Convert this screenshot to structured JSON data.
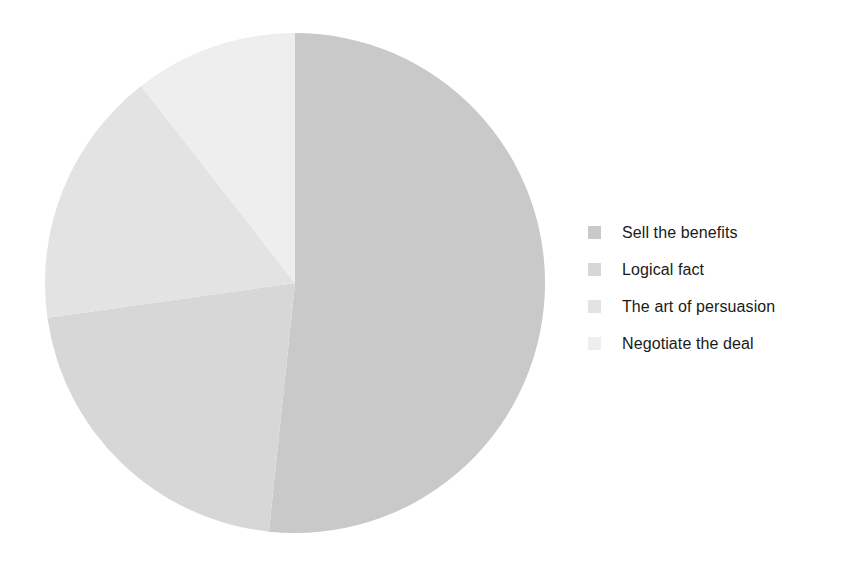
{
  "chart_data": {
    "type": "pie",
    "title": "",
    "subtitle": "",
    "xlabel": "",
    "ylabel": "",
    "grid": false,
    "legend_position": "right",
    "start_angle_deg": 0,
    "direction": "clockwise",
    "categories": [
      "Sell the benefits",
      "Logical fact",
      "The art of persuasion",
      "Negotiate the deal"
    ],
    "values": [
      51.5,
      21.0,
      17.0,
      10.5
    ],
    "unit": "percent",
    "slices": [
      {
        "label": "Sell the benefits",
        "value": 51.5,
        "angle_deg": 186,
        "start_deg": 0,
        "end_deg": 186,
        "color": "#c9c9c9"
      },
      {
        "label": "Logical fact",
        "value": 21.0,
        "angle_deg": 76,
        "start_deg": 186,
        "end_deg": 262,
        "color": "#d7d7d7"
      },
      {
        "label": "The art of persuasion",
        "value": 17.0,
        "angle_deg": 60,
        "start_deg": 262,
        "end_deg": 322,
        "color": "#e3e3e3"
      },
      {
        "label": "Negotiate the deal",
        "value": 10.5,
        "angle_deg": 38,
        "start_deg": 322,
        "end_deg": 360,
        "color": "#eeeeee"
      }
    ],
    "geometry": {
      "center_x": 250,
      "center_y": 250,
      "radius": 250
    }
  },
  "legend": {
    "items": [
      {
        "label": "Sell the benefits",
        "color": "#c9c9c9"
      },
      {
        "label": "Logical fact",
        "color": "#d7d7d7"
      },
      {
        "label": "The art of persuasion",
        "color": "#e3e3e3"
      },
      {
        "label": "Negotiate the deal",
        "color": "#eeeeee"
      }
    ]
  },
  "canvas": {
    "background": "#ffffff",
    "text_color": "#1a1a1a"
  }
}
